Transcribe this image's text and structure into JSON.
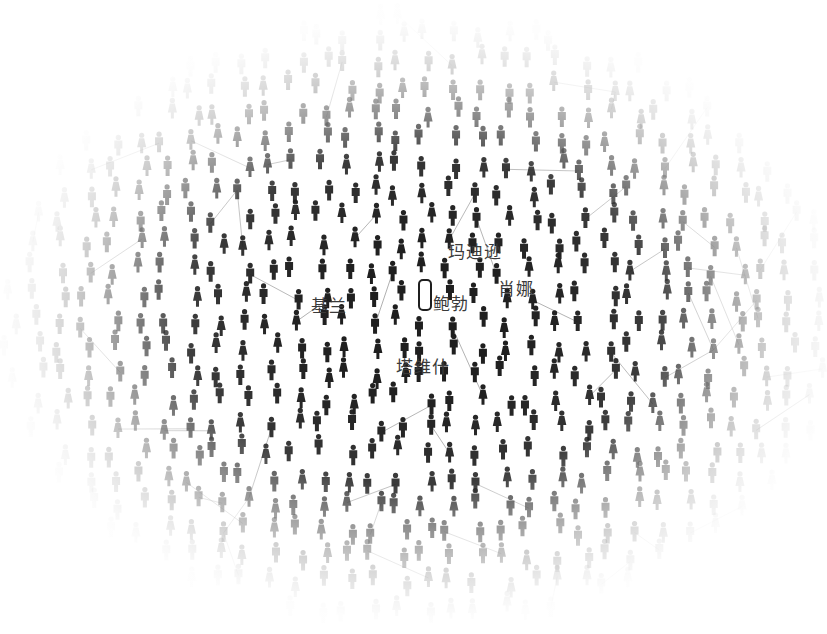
{
  "diagram": {
    "type": "social-network",
    "colors": {
      "figure_dark": "#1f1f1f",
      "edge": "#9a9a9a",
      "highlight_fill": "#ffffff",
      "label_text": "#3a3a3a",
      "background": "#ffffff"
    },
    "center_node": {
      "label": "鲍勃",
      "icon": "person-outline-icon"
    },
    "labels": [
      {
        "id": "madison",
        "text": "玛迪逊",
        "x": 448,
        "y": 238
      },
      {
        "id": "shauna",
        "text": "肖娜",
        "x": 498,
        "y": 275
      },
      {
        "id": "bob",
        "text": "鲍勃",
        "x": 433,
        "y": 290
      },
      {
        "id": "keelan",
        "text": "基兰",
        "x": 311,
        "y": 292
      },
      {
        "id": "tavish",
        "text": "塔维什",
        "x": 396,
        "y": 353
      }
    ]
  }
}
